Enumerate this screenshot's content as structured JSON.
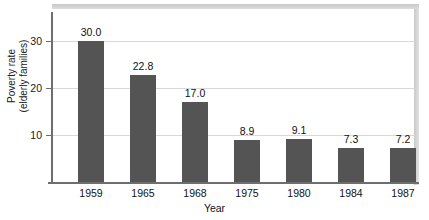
{
  "chart_data": {
    "type": "bar",
    "title": "",
    "subtitle": "",
    "xlabel": "Year",
    "ylabel": "Poverty rate (elderly families)",
    "ylabel_lines": [
      "Poverty rate",
      "(elderly families)"
    ],
    "categories": [
      "1959",
      "1965",
      "1968",
      "1975",
      "1980",
      "1984",
      "1987"
    ],
    "values": [
      30.0,
      22.8,
      17.0,
      8.9,
      9.1,
      7.3,
      7.2
    ],
    "data_labels": [
      "30.0",
      "22.8",
      "17.0",
      "8.9",
      "9.1",
      "7.3",
      "7.2"
    ],
    "yticks": [
      10,
      20,
      30
    ],
    "ytick_labels": [
      "10",
      "20",
      "30"
    ],
    "ylim": [
      0,
      36
    ],
    "grid": true,
    "grid_axis": "y",
    "legend": null,
    "legend_position": "none",
    "bar_color": "#545454",
    "gridline_color": "#d8d8d8",
    "axis_color": "#6e6e6e",
    "background_color": "#ffffff",
    "text_color": "#111111"
  },
  "figure": {
    "top_band_label": "top-shadow-band",
    "right_band_label": "right-shadow-band"
  }
}
